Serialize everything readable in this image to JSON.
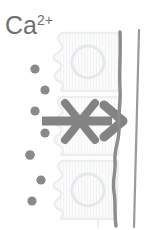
{
  "figure": {
    "width": 155,
    "height": 230,
    "background_color": "#ffffff"
  },
  "ion_label": {
    "element": "Ca",
    "charge": "2+",
    "full_text": "Ca2+",
    "color": "#6f6f6f",
    "position": {
      "x": 5,
      "y": 13
    }
  },
  "ions": {
    "name": "calcium-ions",
    "count": 7,
    "color": "#8a8a8a",
    "radius": 4.6,
    "points": [
      {
        "cx": 35,
        "cy": 69
      },
      {
        "cx": 45,
        "cy": 90
      },
      {
        "cx": 35,
        "cy": 111
      },
      {
        "cx": 45,
        "cy": 133
      },
      {
        "cx": 30,
        "cy": 155
      },
      {
        "cx": 41,
        "cy": 180
      },
      {
        "cx": 32,
        "cy": 201
      }
    ]
  },
  "cells": {
    "name": "epithelial-cell-layer",
    "count": 3,
    "fill_color": "#fafafa",
    "outline_color": "#eceef0",
    "nucleus_color": "#e4e7ea",
    "bands": [
      {
        "top": 32,
        "bottom": 92,
        "has_nucleus": true
      },
      {
        "top": 96,
        "bottom": 156,
        "has_nucleus": false
      },
      {
        "top": 160,
        "bottom": 220,
        "has_nucleus": true
      }
    ]
  },
  "arrow": {
    "name": "transport-arrow",
    "direction": "right",
    "color": "#838383",
    "shaft_start_x": 42,
    "shaft_end_x": 118,
    "y": 121,
    "stroke_width": 9
  },
  "block_mark": {
    "name": "blocked-x-mark",
    "symbol": "X",
    "color": "#838383",
    "center": {
      "x": 80,
      "y": 121
    },
    "size": 34,
    "stroke_width": 8
  },
  "barrier_lines": [
    {
      "name": "wavy-membrane-line",
      "style": "wavy",
      "color": "#8c8c8c",
      "stroke_width": 3.4,
      "x_top": 120,
      "x_bottom": 116
    },
    {
      "name": "straight-membrane-line",
      "style": "straight",
      "color": "#9a9a9a",
      "stroke_width": 2.2,
      "x_top": 139,
      "x_bottom": 134
    }
  ]
}
